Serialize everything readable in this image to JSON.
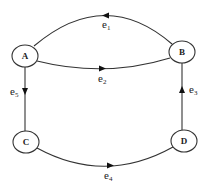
{
  "diagram": {
    "type": "directed-graph",
    "nodes": [
      {
        "id": "A",
        "label": "A",
        "cx": 25,
        "cy": 56
      },
      {
        "id": "B",
        "label": "B",
        "cx": 182,
        "cy": 52
      },
      {
        "id": "C",
        "label": "C",
        "cx": 26,
        "cy": 142
      },
      {
        "id": "D",
        "label": "D",
        "cx": 184,
        "cy": 141
      }
    ],
    "edges": [
      {
        "id": "e1",
        "base": "e",
        "sub": "1",
        "from": "B",
        "to": "A"
      },
      {
        "id": "e2",
        "base": "e",
        "sub": "2",
        "from": "A",
        "to": "B"
      },
      {
        "id": "e3",
        "base": "e",
        "sub": "3",
        "from": "D",
        "to": "B"
      },
      {
        "id": "e4",
        "base": "e",
        "sub": "4",
        "from": "C",
        "to": "D"
      },
      {
        "id": "e5",
        "base": "e",
        "sub": "5",
        "from": "A",
        "to": "C"
      }
    ]
  }
}
